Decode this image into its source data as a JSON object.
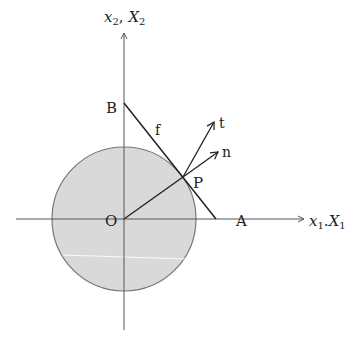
{
  "diagram": {
    "type": "geometry",
    "colors": {
      "circle_fill": "#d9d9d9",
      "circle_stroke": "#777777",
      "line": "#222222",
      "axis": "#555555",
      "background": "#ffffff"
    },
    "axes": {
      "horizontal": {
        "label_main": "x",
        "label_sub1": "1",
        "separator": ".",
        "label_main2": "X",
        "label_sub2": "1"
      },
      "vertical": {
        "label_main": "x",
        "label_sub1": "2",
        "separator": ", ",
        "label_main2": "X",
        "label_sub2": "2"
      }
    },
    "points": {
      "origin": {
        "label": "O"
      },
      "A": {
        "label": "A"
      },
      "B": {
        "label": "B"
      },
      "P": {
        "label": "P"
      }
    },
    "line": {
      "label": "f"
    },
    "vectors": {
      "tangent": {
        "label": "t"
      },
      "normal": {
        "label": "n"
      }
    }
  }
}
